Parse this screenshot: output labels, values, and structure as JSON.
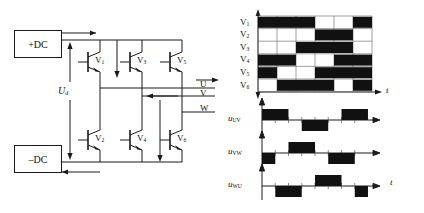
{
  "figure": {
    "type": "three-phase-bridge-inverter-with-switching-waveforms",
    "caption": ""
  },
  "circuit": {
    "dc_positive_label": "+DC",
    "dc_negative_label": "–DC",
    "dc_voltage_symbol": "U",
    "dc_voltage_subscript": "d",
    "switches": [
      {
        "name": "V",
        "sub": "1",
        "position": "upper-leg-U"
      },
      {
        "name": "V",
        "sub": "3",
        "position": "upper-leg-V"
      },
      {
        "name": "V",
        "sub": "5",
        "position": "upper-leg-W"
      },
      {
        "name": "V",
        "sub": "2",
        "position": "lower-leg-U"
      },
      {
        "name": "V",
        "sub": "4",
        "position": "lower-leg-V"
      },
      {
        "name": "V",
        "sub": "6",
        "position": "lower-leg-W"
      }
    ],
    "outputs": [
      {
        "label": "U"
      },
      {
        "label": "V"
      },
      {
        "label": "W"
      }
    ]
  },
  "gate_timing": {
    "time_axis_label": "t",
    "period_divisions": 6,
    "rows": [
      {
        "name": "V",
        "sub": "1",
        "pulses": [
          [
            0.0,
            0.5
          ],
          [
            0.833,
            1.0
          ]
        ]
      },
      {
        "name": "V",
        "sub": "2",
        "pulses": [
          [
            0.5,
            0.833
          ]
        ]
      },
      {
        "name": "V",
        "sub": "3",
        "pulses": [
          [
            0.333,
            0.833
          ]
        ]
      },
      {
        "name": "V",
        "sub": "4",
        "pulses": [
          [
            0.0,
            0.333
          ],
          [
            0.667,
            1.0
          ]
        ]
      },
      {
        "name": "V",
        "sub": "5",
        "pulses": [
          [
            0.0,
            0.167
          ],
          [
            0.5,
            1.0
          ]
        ]
      },
      {
        "name": "V",
        "sub": "6",
        "pulses": [
          [
            0.167,
            0.667
          ],
          [
            0.833,
            1.0
          ]
        ]
      }
    ]
  },
  "line_voltages": {
    "time_axis_label": "t",
    "waveforms": [
      {
        "name": "u",
        "sub": "UV",
        "segments": [
          {
            "from": 0.0,
            "to": 0.333,
            "level": 1
          },
          {
            "from": 0.333,
            "to": 0.5,
            "level": 0
          },
          {
            "from": 0.5,
            "to": 0.833,
            "level": -1
          },
          {
            "from": 0.833,
            "to": 1.0,
            "level": 0
          },
          {
            "from": 1.0,
            "to": 1.333,
            "level": 1
          }
        ]
      },
      {
        "name": "u",
        "sub": "VW",
        "segments": [
          {
            "from": 0.0,
            "to": 0.167,
            "level": -1
          },
          {
            "from": 0.167,
            "to": 0.333,
            "level": 0
          },
          {
            "from": 0.333,
            "to": 0.667,
            "level": 1
          },
          {
            "from": 0.667,
            "to": 0.833,
            "level": 0
          },
          {
            "from": 0.833,
            "to": 1.167,
            "level": -1
          }
        ]
      },
      {
        "name": "u",
        "sub": "WU",
        "segments": [
          {
            "from": 0.0,
            "to": 0.167,
            "level": 0
          },
          {
            "from": 0.167,
            "to": 0.5,
            "level": -1
          },
          {
            "from": 0.5,
            "to": 0.667,
            "level": 0
          },
          {
            "from": 0.667,
            "to": 1.0,
            "level": 1
          },
          {
            "from": 1.0,
            "to": 1.167,
            "level": 0
          },
          {
            "from": 1.167,
            "to": 1.333,
            "level": -1
          }
        ]
      }
    ]
  }
}
